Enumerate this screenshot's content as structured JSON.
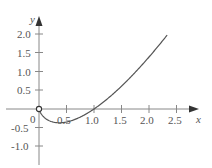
{
  "chart_data": {
    "type": "line",
    "title": "",
    "function": "y = x ln x",
    "xlabel": "x",
    "ylabel": "y",
    "xlim": [
      0,
      2.8
    ],
    "ylim": [
      -1.3,
      2.3
    ],
    "grid": false,
    "legend": null,
    "x_ticks": [
      "0.5",
      "1.0",
      "1.5",
      "2.0",
      "2.5"
    ],
    "y_ticks": [
      "2.0",
      "1.5",
      "1.0",
      "0.5",
      "-0.5",
      "-1.0"
    ],
    "origin_label": "0",
    "open_point": [
      0,
      0
    ],
    "series": [
      {
        "name": "y = x ln x",
        "x": [
          0.0,
          0.1,
          0.2,
          0.3,
          0.368,
          0.5,
          0.7,
          1.0,
          1.3,
          1.6,
          1.9,
          2.1,
          2.33
        ],
        "y": [
          0.0,
          -0.23,
          -0.32,
          -0.36,
          -0.37,
          -0.35,
          -0.25,
          0.0,
          0.34,
          0.75,
          1.22,
          1.56,
          1.97
        ]
      }
    ]
  }
}
